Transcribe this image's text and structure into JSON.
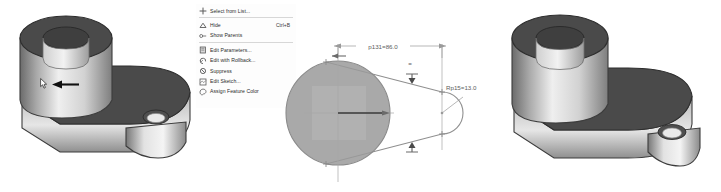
{
  "scene": {
    "background_color": "#ffffff",
    "panels": [
      {
        "name": "left-model-view",
        "caption": "3D shaded solid model of crank arm (before edit)"
      },
      {
        "name": "context-menu-view",
        "caption": "Feature right-click context menu"
      },
      {
        "name": "sketch-view",
        "caption": "2D sketch of crank arm profile with dimensions"
      },
      {
        "name": "right-model-view",
        "caption": "3D shaded solid model of crank arm (after edit)"
      }
    ]
  },
  "context_menu": {
    "name": "feature-context-menu",
    "items": [
      {
        "label": "Select from List...",
        "accel": "",
        "icon": "select-from-list-icon",
        "separator_after": true
      },
      {
        "label": "Hide",
        "accel": "Ctrl+B",
        "icon": "hide-icon",
        "separator_after": false
      },
      {
        "label": "Show Parents",
        "accel": "",
        "icon": "show-parents-icon",
        "separator_after": true
      },
      {
        "label": "Edit Parameters...",
        "accel": "",
        "icon": "edit-parameters-icon",
        "separator_after": false
      },
      {
        "label": "Edit with Rollback...",
        "accel": "",
        "icon": "edit-rollback-icon",
        "separator_after": false
      },
      {
        "label": "Suppress",
        "accel": "",
        "icon": "suppress-icon",
        "separator_after": false
      },
      {
        "label": "Edit Sketch...",
        "accel": "",
        "icon": "edit-sketch-icon",
        "separator_after": false
      },
      {
        "label": "Assign Feature Color",
        "accel": "",
        "icon": "assign-feature-color-icon",
        "separator_after": false
      }
    ],
    "highlighted_item": "Edit Sketch...",
    "pointer": {
      "name": "mouse-cursor",
      "target": "Edit Sketch..."
    },
    "annotation_arrow": {
      "name": "callout-arrow",
      "direction": "left",
      "color": "#111111"
    }
  },
  "sketch": {
    "name": "crank-profile-sketch",
    "entity_fill_color": "#9a9a9a",
    "line_color": "#8a8a8a",
    "dimension_color": "#5d5d5d",
    "dimensions": [
      {
        "name": "length-dimension",
        "label": "p131=86.0",
        "parameter": "p131",
        "value": "86.0"
      },
      {
        "name": "radius-dimension",
        "label": "Rp15=13.0",
        "parameter": "Rp15",
        "value": "13.0"
      }
    ],
    "constraints": [
      {
        "name": "equal-constraint-top",
        "symbol": "="
      },
      {
        "name": "tangent-marker-top",
        "symbol": "T"
      },
      {
        "name": "tangent-marker-bottom",
        "symbol": "T"
      }
    ]
  },
  "model": {
    "name": "crank-arm-part",
    "top_face_color": "#4a4a4a",
    "side_highlight_color": "#e8e8e8",
    "side_shadow_color": "#6e6e6e",
    "features": [
      "large-boss-with-bore",
      "arm-web",
      "small-boss-with-hole"
    ]
  }
}
